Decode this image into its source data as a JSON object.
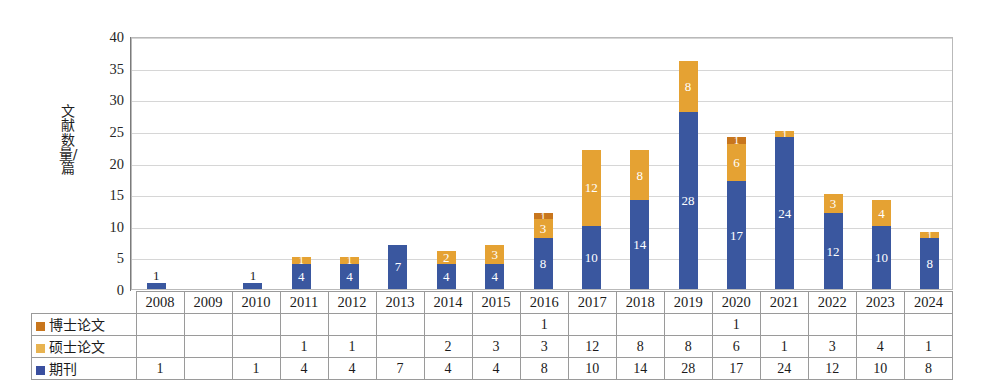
{
  "chart_data": {
    "type": "bar",
    "subtype": "stacked-bar-with-data-table",
    "title": "",
    "xlabel": "",
    "ylabel": "文献数量/篇",
    "ylim": [
      0,
      40
    ],
    "yticks": [
      0,
      5,
      10,
      15,
      20,
      25,
      30,
      35,
      40
    ],
    "grid": true,
    "legend_position": "data-table-row-labels",
    "categories": [
      "2008",
      "2009",
      "2010",
      "2011",
      "2012",
      "2013",
      "2014",
      "2015",
      "2016",
      "2017",
      "2018",
      "2019",
      "2020",
      "2021",
      "2022",
      "2023",
      "2024"
    ],
    "series": [
      {
        "name": "期刊",
        "color": "#3a579f",
        "values": [
          1,
          null,
          1,
          4,
          4,
          7,
          4,
          4,
          8,
          10,
          14,
          28,
          17,
          24,
          12,
          10,
          8
        ]
      },
      {
        "name": "硕士论文",
        "color": "#e5a233",
        "values": [
          null,
          null,
          null,
          1,
          1,
          null,
          2,
          3,
          3,
          12,
          8,
          8,
          6,
          1,
          3,
          4,
          1
        ]
      },
      {
        "name": "博士论文",
        "color": "#c8761d",
        "values": [
          null,
          null,
          null,
          null,
          null,
          null,
          null,
          null,
          1,
          null,
          null,
          null,
          1,
          null,
          null,
          null,
          null
        ]
      }
    ],
    "totals": [
      1,
      0,
      1,
      5,
      5,
      7,
      6,
      7,
      12,
      22,
      22,
      36,
      24,
      25,
      15,
      14,
      9
    ],
    "stack_order_bottom_to_top": [
      "期刊",
      "硕士论文",
      "博士论文"
    ]
  },
  "axis": {
    "y_title": "文献数量/篇",
    "y_tick_labels": [
      "40",
      "35",
      "30",
      "25",
      "20",
      "15",
      "10",
      "5",
      "0"
    ]
  },
  "table": {
    "row_labels": [
      "博士论文",
      "硕士论文",
      "期刊"
    ],
    "years": [
      "2008",
      "2009",
      "2010",
      "2011",
      "2012",
      "2013",
      "2014",
      "2015",
      "2016",
      "2017",
      "2018",
      "2019",
      "2020",
      "2021",
      "2022",
      "2023",
      "2024"
    ],
    "rows": [
      {
        "label": "博士论文",
        "swatch_color": "#c8761d",
        "cells": [
          "",
          "",
          "",
          "",
          "",
          "",
          "",
          "",
          "1",
          "",
          "",
          "",
          "1",
          "",
          "",
          "",
          ""
        ]
      },
      {
        "label": "硕士论文",
        "swatch_color": "#e8b351",
        "cells": [
          "",
          "",
          "",
          "1",
          "1",
          "",
          "2",
          "3",
          "3",
          "12",
          "8",
          "8",
          "6",
          "1",
          "3",
          "4",
          "1"
        ]
      },
      {
        "label": "期刊",
        "swatch_color": "#3a4f9f",
        "cells": [
          "1",
          "",
          "1",
          "4",
          "4",
          "7",
          "4",
          "4",
          "8",
          "10",
          "14",
          "28",
          "17",
          "24",
          "12",
          "10",
          "8"
        ]
      }
    ]
  },
  "bar_labels": {
    "journal": [
      "1",
      "",
      "1",
      "4",
      "4",
      "7",
      "4",
      "4",
      "8",
      "10",
      "14",
      "28",
      "17",
      "24",
      "12",
      "10",
      "8"
    ],
    "master": [
      "",
      "",
      "",
      "1",
      "1",
      "",
      "2",
      "3",
      "3",
      "12",
      "8",
      "8",
      "6",
      "1",
      "3",
      "4",
      "1"
    ],
    "doctor": [
      "",
      "",
      "",
      "",
      "",
      "",
      "",
      "",
      "1",
      "",
      "",
      "",
      "1",
      "",
      "",
      "",
      ""
    ]
  },
  "colors": {
    "journal": "#3a579f",
    "master": "#e5a233",
    "doctor": "#c8761d",
    "gridline": "#d6d6d6",
    "plot_border": "#b9b9b9",
    "table_border": "#9a9a9a"
  }
}
